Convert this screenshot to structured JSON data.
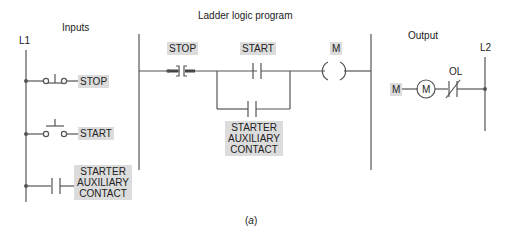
{
  "diagram": {
    "sections": {
      "inputs_title": "Inputs",
      "program_title": "Ladder logic program",
      "output_title": "Output"
    },
    "rails": {
      "left": "L1",
      "right": "L2"
    },
    "inputs": [
      {
        "name": "STOP",
        "type": "normally-closed-pushbutton"
      },
      {
        "name": "START",
        "type": "normally-open-pushbutton"
      },
      {
        "name_lines": [
          "STARTER",
          "AUXILIARY",
          "CONTACT"
        ],
        "type": "normally-open-contact"
      }
    ],
    "program": {
      "stop_label": "STOP",
      "start_label": "START",
      "coil_label": "M",
      "aux_label_lines": [
        "STARTER",
        "AUXILIARY",
        "CONTACT"
      ]
    },
    "output": {
      "tag": "M",
      "motor_label": "M",
      "overload_label": "OL"
    },
    "caption_open": "(",
    "caption_letter": "a",
    "caption_close": ")",
    "colors": {
      "line": "#555555",
      "label_bg": "#dcdcdc",
      "text": "#222222"
    }
  }
}
